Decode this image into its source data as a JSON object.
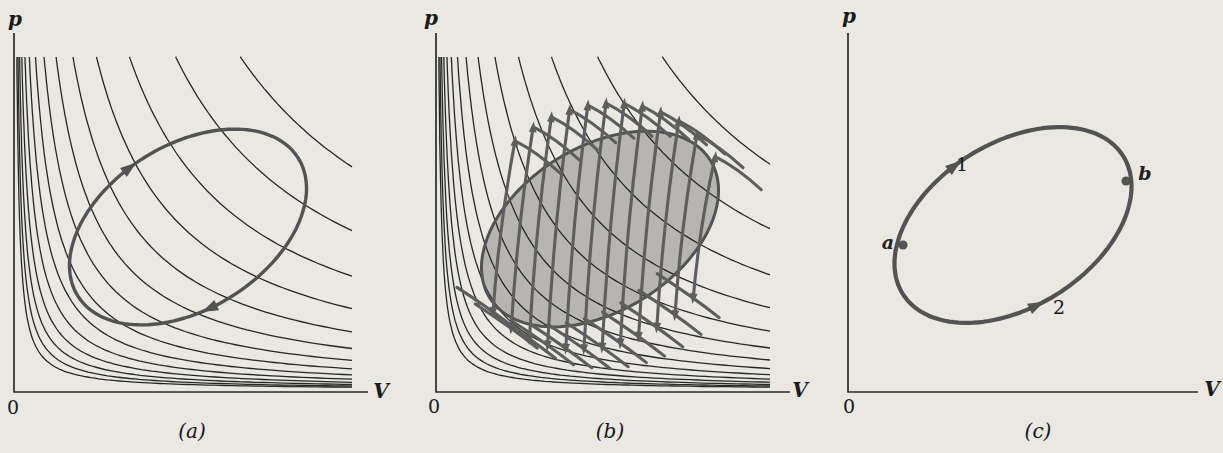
{
  "figure": {
    "bg": "#e9e8e3",
    "axis_color": "#2c2c2c",
    "isotherm_color": "#272727",
    "cycle_color": "#535353",
    "zigzag_color": "#5e5e5e",
    "fill_color": "#b6b5b1",
    "text_color": "#1b1b1b"
  },
  "panels": [
    {
      "id": "a",
      "caption": "(a)",
      "labels": {
        "pressure": "p",
        "volume": "V",
        "origin": "0"
      },
      "show_isotherms": true,
      "show_fill": false,
      "geometry": {
        "axis_x": 14,
        "axis_top": 33,
        "axis_bottom": 392,
        "axis_right": 368,
        "isotherms": {
          "count": 14,
          "c0": 950,
          "ratio": 1.4,
          "clip_top": 57,
          "clip_right": 352,
          "y0": 390
        },
        "cycle": {
          "cx": 188,
          "cy": 227,
          "a": 130,
          "b": 82,
          "angle_deg": -32,
          "width": 3.4
        },
        "cycle_arrows": [
          {
            "phi_deg": 262,
            "dir": 1
          },
          {
            "phi_deg": 101,
            "dir": 1
          }
        ]
      }
    },
    {
      "id": "b",
      "caption": "(b)",
      "labels": {
        "pressure": "p",
        "volume": "V",
        "origin": "0"
      },
      "show_isotherms": true,
      "show_fill": true,
      "geometry": {
        "axis_x": 28,
        "axis_top": 33,
        "axis_bottom": 392,
        "axis_right": 382,
        "isotherms": {
          "count": 14,
          "c0": 950,
          "ratio": 1.4,
          "clip_top": 57,
          "clip_right": 362,
          "y0": 390
        },
        "cycle": {
          "cx": 192,
          "cy": 229,
          "a": 130,
          "b": 82,
          "angle_deg": -32,
          "width": 3.0
        },
        "zigzag": {
          "strokes": 12,
          "x_start": 96,
          "x_step": 18.2,
          "lean": 11,
          "offset_top": 40,
          "offset_bottom": 32,
          "width": 3.1
        }
      }
    },
    {
      "id": "c",
      "caption": "(c)",
      "labels": {
        "pressure": "p",
        "volume": "V",
        "origin": "0"
      },
      "show_isotherms": false,
      "show_fill": false,
      "geometry": {
        "axis_x": 32,
        "axis_top": 33,
        "axis_bottom": 392,
        "axis_right": 382,
        "cycle": {
          "cx": 197,
          "cy": 225,
          "a": 130,
          "b": 82,
          "angle_deg": -32,
          "width": 4.2
        },
        "cycle_arrows": [
          {
            "phi_deg": 262,
            "dir": 1
          },
          {
            "phi_deg": 100,
            "dir": -1
          }
        ],
        "points": [
          {
            "label": "a",
            "pos": [
              87,
              245
            ]
          },
          {
            "label": "b",
            "pos": [
              310,
              181
            ]
          }
        ]
      },
      "path_labels": [
        {
          "label": "1"
        },
        {
          "label": "2"
        }
      ]
    }
  ],
  "chart_data": [
    {
      "type": "line",
      "panel": "a",
      "xlabel": "V",
      "ylabel": "p",
      "origin_tick": "0",
      "description": "Family of 14 isotherms pV = constant (hyperbolas) with a superimposed closed thermodynamic cycle traversed clockwise (arrows on upper-left and lower-right of loop).",
      "isotherm_family": {
        "equation": "p = c / V",
        "constants_rule": "c_i = 950 * 1.4^i, i = 0..13 (arbitrary units)"
      },
      "cycle": {
        "shape": "rotated oval",
        "direction": "clockwise"
      },
      "axis_ranges": "unlabeled (qualitative sketch)"
    },
    {
      "type": "line",
      "panel": "b",
      "xlabel": "V",
      "ylabel": "p",
      "origin_tick": "0",
      "description": "Same isotherm family and cycle; enclosed area shaded gray and cycle approximated by 12 alternating adiabat strokes (steep, arrow-tipped) joined by short isothermal segments, forming a sawtooth band around the loop.",
      "isotherm_family": {
        "equation": "p = c / V",
        "constants_rule": "c_i = 950 * 1.4^i, i = 0..13 (arbitrary units)"
      },
      "cycle": {
        "shape": "rotated oval",
        "area": "shaded"
      }
    },
    {
      "type": "line",
      "panel": "c",
      "xlabel": "V",
      "ylabel": "p",
      "origin_tick": "0",
      "description": "Bare closed cycle with state points a (left, lower pressure-volume) and b (right) marked by dots; path 1 runs a to b along the upper branch, path 2 runs a to b along the lower branch (both arrows point toward b).",
      "points": [
        "a",
        "b"
      ],
      "paths": [
        "1",
        "2"
      ]
    }
  ]
}
